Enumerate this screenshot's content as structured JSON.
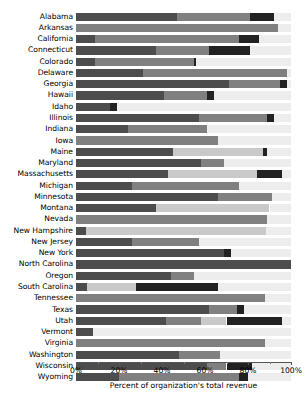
{
  "chart_data": {
    "type": "bar",
    "orientation": "horizontal",
    "stacked": true,
    "normalized": true,
    "title": "",
    "xlabel": "Percent of organization's total revenue",
    "ylabel": "",
    "xlim": [
      0,
      100
    ],
    "xticks": [
      0,
      20,
      40,
      60,
      80,
      100
    ],
    "xtick_labels": [
      "0%",
      "20%",
      "40%",
      "60%",
      "80%",
      "100%"
    ],
    "minor_xticks": [
      10,
      30,
      50,
      70,
      90
    ],
    "grid": false,
    "legend": "none",
    "categories": [
      "Alabama",
      "Arkansas",
      "California",
      "Connecticut",
      "Colorado",
      "Delaware",
      "Georgia",
      "Hawaii",
      "Idaho",
      "Illinois",
      "Indiana",
      "Iowa",
      "Maine",
      "Maryland",
      "Massachusetts",
      "Michigan",
      "Minnesota",
      "Montana",
      "Nevada",
      "New Hampshire",
      "New Jersey",
      "New York",
      "North Carolina",
      "Oregon",
      "South Carolina",
      "Tennessee",
      "Texas",
      "Utah",
      "Vermont",
      "Virginia",
      "Washington",
      "Wisconsin",
      "Wyoming"
    ],
    "series": [
      {
        "name": "segment-1",
        "color": "#4d4d4d",
        "values": [
          47.0,
          0.0,
          9.0,
          37.0,
          9.0,
          31.0,
          71.0,
          41.0,
          16.0,
          57.0,
          24.0,
          0.0,
          45.0,
          58.0,
          43.0,
          26.0,
          66.0,
          37.0,
          0.0,
          4.5,
          26.0,
          69.0,
          100.0,
          44.0,
          5.0,
          0.0,
          62.0,
          42.0,
          8.0,
          0.0,
          48.0,
          61.0,
          20.0
        ]
      },
      {
        "name": "segment-2",
        "color": "#808080",
        "values": [
          34.0,
          94.0,
          67.0,
          25.0,
          46.0,
          67.0,
          24.0,
          20.0,
          0.0,
          32.0,
          37.0,
          66.0,
          0.0,
          11.0,
          0.0,
          50.0,
          25.0,
          0.0,
          89.0,
          0.0,
          31.0,
          0.0,
          0.0,
          11.0,
          0.0,
          88.0,
          13.0,
          16.0,
          0.0,
          88.0,
          19.0,
          9.0,
          56.0
        ]
      },
      {
        "name": "segment-3",
        "color": "#c9c9c9",
        "values": [
          0.0,
          0.0,
          0.0,
          0.0,
          0.0,
          0.0,
          0.0,
          0.0,
          0.0,
          0.0,
          0.0,
          0.0,
          42.0,
          0.0,
          41.0,
          0.0,
          0.0,
          53.0,
          0.0,
          84.0,
          0.0,
          0.0,
          0.0,
          0.0,
          23.0,
          0.0,
          0.0,
          12.0,
          0.0,
          0.0,
          0.0,
          0.0,
          0.0
        ]
      },
      {
        "name": "segment-4",
        "color": "#222222",
        "values": [
          11.0,
          0.0,
          9.0,
          19.0,
          1.0,
          0.0,
          3.0,
          3.0,
          3.0,
          3.0,
          0.0,
          0.0,
          2.0,
          0.0,
          12.0,
          0.0,
          0.0,
          0.0,
          0.0,
          0.0,
          0.0,
          3.0,
          0.0,
          0.0,
          38.0,
          0.0,
          3.0,
          26.0,
          0.0,
          0.0,
          0.0,
          12.0,
          4.0
        ]
      },
      {
        "name": "segment-5",
        "color": "#ededed",
        "values": [
          8.0,
          6.0,
          15.0,
          19.0,
          44.0,
          2.0,
          2.0,
          36.0,
          81.0,
          8.0,
          39.0,
          34.0,
          11.0,
          31.0,
          4.0,
          24.0,
          9.0,
          10.0,
          11.0,
          11.5,
          43.0,
          28.0,
          0.0,
          45.0,
          34.0,
          12.0,
          22.0,
          4.0,
          92.0,
          12.0,
          33.0,
          18.0,
          20.0
        ]
      }
    ]
  }
}
